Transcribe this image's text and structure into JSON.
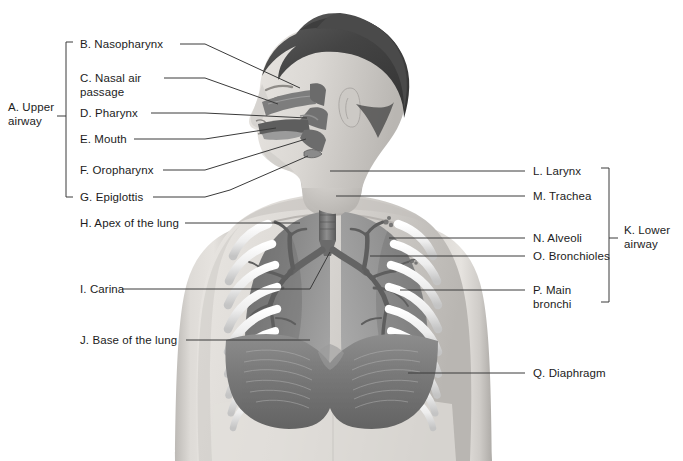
{
  "figure": {
    "background": "#ffffff",
    "text_color": "#1c1c1c",
    "leader_color": "#3a3a3a"
  },
  "groups": {
    "upper": {
      "key": "A",
      "label": "A. Upper\nairway"
    },
    "lower": {
      "key": "K",
      "label": "K. Lower\nairway"
    }
  },
  "labels_left": [
    {
      "key": "B",
      "label": "B. Nasopharynx"
    },
    {
      "key": "C",
      "label": "C. Nasal air\npassage"
    },
    {
      "key": "D",
      "label": "D. Pharynx"
    },
    {
      "key": "E",
      "label": "E. Mouth"
    },
    {
      "key": "F",
      "label": "F. Oropharynx"
    },
    {
      "key": "G",
      "label": "G. Epiglottis"
    },
    {
      "key": "H",
      "label": "H. Apex of the lung"
    },
    {
      "key": "I",
      "label": "I. Carina"
    },
    {
      "key": "J",
      "label": "J. Base of the lung"
    }
  ],
  "labels_right": [
    {
      "key": "L",
      "label": "L. Larynx"
    },
    {
      "key": "M",
      "label": "M. Trachea"
    },
    {
      "key": "N",
      "label": "N. Alveoli"
    },
    {
      "key": "O",
      "label": "O. Bronchioles"
    },
    {
      "key": "P",
      "label": "P. Main\nbronchi"
    },
    {
      "key": "Q",
      "label": "Q. Diaphragm"
    }
  ],
  "anatomy": {
    "view": "anterior torso with left-facing head profile cutaway",
    "parts": [
      "hair",
      "head-profile",
      "nasal-air-passage",
      "nasopharynx",
      "pharynx",
      "mouth",
      "oropharynx",
      "epiglottis",
      "larynx",
      "trachea",
      "carina",
      "main-bronchi",
      "bronchioles",
      "alveoli",
      "left-lung",
      "right-lung",
      "ribs",
      "diaphragm",
      "torso"
    ],
    "palette": {
      "skin": "#d7d4d0",
      "skin_shadow": "#b3b0ac",
      "hair": "#4e4e4e",
      "lung": "#8d8d8d",
      "lung_dark": "#6f6f6f",
      "airway": "#7a7a7a",
      "airway_dark": "#5a5a5a",
      "rib": "#f2f2f2",
      "diaphragm": "#7e7e7e"
    }
  }
}
